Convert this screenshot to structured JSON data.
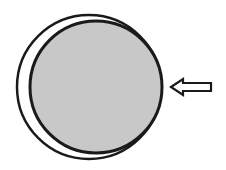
{
  "diagram": {
    "colors": {
      "stroke": "#1a1a1a",
      "inner_fill": "#c8c8c8",
      "background": "#ffffff",
      "arrow_fill": "#ffffff"
    },
    "outer_circle": {
      "cx": 89,
      "cy": 87,
      "r": 72
    },
    "inner_circle": {
      "cx": 96,
      "cy": 87,
      "r": 66
    },
    "arrow": {
      "direction": "left",
      "tip_x": 170,
      "tip_y": 87,
      "tail_x": 212
    }
  }
}
